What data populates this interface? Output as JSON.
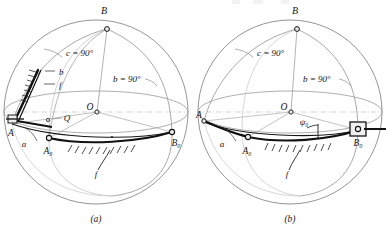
{
  "figure": {
    "title_fragment_top": "",
    "panels": [
      {
        "id": "a",
        "caption": "(a)",
        "labels": {
          "apex": "B",
          "center": "O",
          "point_A": "A",
          "point_A0": "A₀",
          "point_B0": "B₀",
          "point_Q": "Q",
          "arc_a": "a",
          "arc_b": "b",
          "arc_f_upper": "f",
          "arc_f_lower": "f",
          "angle_c": "c = 90°",
          "angle_b": "b = 90°"
        }
      },
      {
        "id": "b",
        "caption": "(b)",
        "labels": {
          "apex": "B",
          "center": "O",
          "point_A": "A",
          "point_A0": "A₀",
          "point_B0": "B₀",
          "arc_a": "a",
          "arc_f": "f",
          "angle_psi": "ψ₀",
          "angle_c": "c = 90°",
          "angle_b": "b = 90°"
        }
      }
    ]
  },
  "colors": {
    "ink": "#161616",
    "sphere_outline": "#7a7a7a",
    "construction_line": "#8f8f8f",
    "heavy_arc": "#111111",
    "paper": "#ffffff",
    "node_fill": "#e9e9e9"
  },
  "geometry": {
    "panel_a": {
      "sphere_center": [
        96,
        112
      ],
      "sphere_radius": 92,
      "apex_B": [
        107,
        29
      ],
      "center_O": [
        97,
        112
      ],
      "point_A": [
        12,
        124
      ],
      "point_A0": [
        49,
        138
      ],
      "point_B0": [
        172,
        132
      ],
      "point_Q": [
        48,
        118
      ]
    },
    "panel_b": {
      "sphere_center": [
        290,
        112
      ],
      "sphere_radius": 92,
      "apex_B": [
        297,
        29
      ],
      "center_O": [
        291,
        112
      ],
      "point_A": [
        204,
        121
      ],
      "point_A0": [
        248,
        137
      ],
      "point_B0": [
        358,
        130
      ]
    }
  }
}
